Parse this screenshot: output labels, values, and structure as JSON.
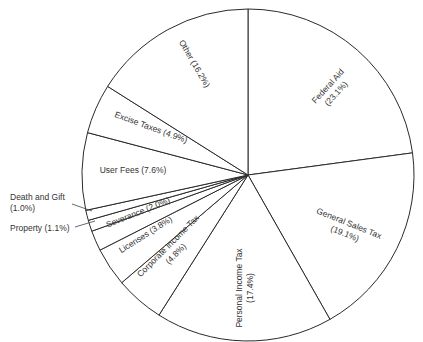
{
  "chart_data": {
    "type": "pie",
    "title": "",
    "unit": "percent",
    "start_angle_deg": -90,
    "direction": "clockwise",
    "center": [
      248,
      175
    ],
    "radius": 166,
    "categories": [
      "Federal Aid",
      "General Sales Tax",
      "Personal Income Tax",
      "Corporate Income Tax",
      "Licenses",
      "Severance",
      "Property",
      "Death and Gift",
      "User Fees",
      "Excise Taxes",
      "Other"
    ],
    "values": [
      23.1,
      19.1,
      17.4,
      4.8,
      3.8,
      2.0,
      1.1,
      1.0,
      7.6,
      4.9,
      16.2
    ],
    "labels": [
      {
        "lines": [
          "Federal Aid",
          "(23.1%)"
        ],
        "x": 330,
        "y": 88,
        "rotate": -48
      },
      {
        "lines": [
          "General Sales Tax",
          "(19.1%)"
        ],
        "x": 348,
        "y": 226,
        "rotate": 22
      },
      {
        "lines": [
          "Personal Income Tax",
          "(17.4%)"
        ],
        "x": 242,
        "y": 288,
        "rotate": -90
      },
      {
        "lines": [
          "Corporate Income Tax",
          "(4.8%)"
        ],
        "x": 170,
        "y": 248,
        "rotate": -45
      },
      {
        "lines": [
          "Licenses (3.8%)"
        ],
        "x": 147,
        "y": 237,
        "rotate": -32
      },
      {
        "lines": [
          "Severance (2.0%)"
        ],
        "x": 139,
        "y": 215,
        "rotate": -22
      },
      {
        "lines": [
          "Property (1.1%)"
        ],
        "x": 10,
        "y": 231,
        "rotate": 0,
        "leader": [
          [
            75,
            227
          ],
          [
            95,
            221
          ]
        ]
      },
      {
        "lines": [
          "Death and Gift",
          "(1.0%)"
        ],
        "x": 10,
        "y": 200,
        "rotate": 0,
        "leader": [
          [
            72,
            204
          ],
          [
            92,
            211
          ]
        ]
      },
      {
        "lines": [
          "User Fees (7.6%)"
        ],
        "x": 133,
        "y": 173,
        "rotate": 0
      },
      {
        "lines": [
          "Excise Taxes (4.9%)"
        ],
        "x": 150,
        "y": 130,
        "rotate": 20
      },
      {
        "lines": [
          "Other (16.2%)"
        ],
        "x": 192,
        "y": 65,
        "rotate": 60
      }
    ]
  }
}
